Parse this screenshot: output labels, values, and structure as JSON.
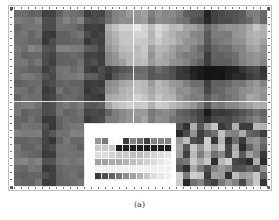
{
  "figure": {
    "caption": "(a)",
    "grid": {
      "cols": 36,
      "rows": 25,
      "cell_w": 7.03,
      "cell_h": 7.04
    },
    "regions": {
      "left_dark": {
        "col_end": 13,
        "row_end": 16,
        "col_end_lower": 10
      },
      "inset": {
        "col_start": 10,
        "row_start": 16,
        "col_end": 23,
        "row_end": 25
      },
      "bottom_right_random": {
        "col_start": 23,
        "row_start": 16
      }
    },
    "inset_legend": [
      "legend",
      "item",
      "item"
    ]
  }
}
